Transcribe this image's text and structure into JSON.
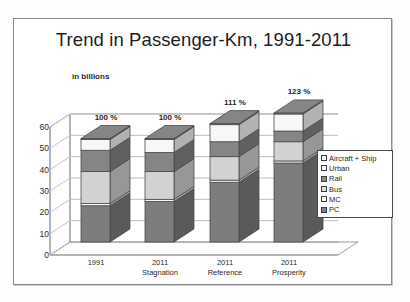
{
  "chart_data": {
    "type": "bar",
    "stacked": true,
    "title": "Trend in Passenger-Km, 1991-2011",
    "subtitle": "in billions",
    "xlabel": "",
    "ylabel": "",
    "ylim": [
      0,
      60
    ],
    "yticks": [
      "0",
      "10",
      "20",
      "30",
      "40",
      "50",
      "60"
    ],
    "grid": true,
    "legend_position": "right",
    "categories": [
      "1991",
      "2011 Stagnation",
      "2011 Reference",
      "2011 Prosperity"
    ],
    "category_lines": [
      [
        "1991",
        ""
      ],
      [
        "2011",
        "Stagnation"
      ],
      [
        "2011",
        "Reference"
      ],
      [
        "2011",
        "Prosperity"
      ]
    ],
    "series": [
      {
        "name": "PC",
        "color": "#7d7d7d",
        "values": [
          17,
          19,
          28,
          37
        ]
      },
      {
        "name": "MC",
        "color": "#f5f5f5",
        "values": [
          1.0,
          1.0,
          1.0,
          1.0
        ]
      },
      {
        "name": "Bus",
        "color": "#d2d2d2",
        "values": [
          15,
          13,
          11,
          9
        ]
      },
      {
        "name": "Rail",
        "color": "#858585",
        "values": [
          10,
          9,
          7,
          5
        ]
      },
      {
        "name": "Urban",
        "color": "#f7f7f7",
        "values": [
          5,
          6,
          8,
          8
        ]
      },
      {
        "name": "Aircraft + Ship",
        "color": "#9b9b9b",
        "values": [
          0.5,
          0.5,
          0.5,
          0.5
        ]
      }
    ],
    "totals": [
      48.5,
      48.5,
      55.5,
      60.5
    ],
    "data_labels": [
      "100 %",
      "100 %",
      "111 %",
      "123 %"
    ]
  },
  "legend": {
    "items": [
      {
        "label": "Aircraft + Ship",
        "color": "#f7f7f7"
      },
      {
        "label": "Urban",
        "color": "#f7f7f7"
      },
      {
        "label": "Rail",
        "color": "#8a8a8a"
      },
      {
        "label": "Bus",
        "color": "#dcdcdc"
      },
      {
        "label": "MC",
        "color": "#f7f7f7"
      },
      {
        "label": "PC",
        "color": "#808080"
      }
    ]
  }
}
